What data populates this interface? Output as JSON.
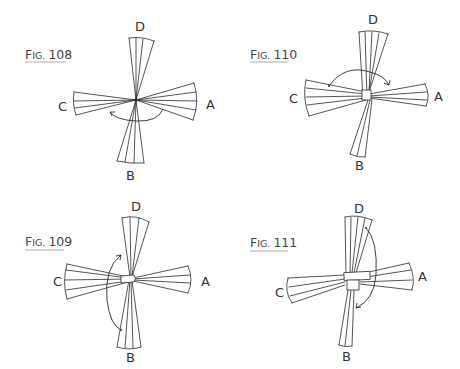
{
  "figures": [
    {
      "id": "fig108",
      "caption": {
        "prefix": "F",
        "small": "IG.",
        "number": "108"
      },
      "labels": {
        "top": "D",
        "bottom": "B",
        "left": "C",
        "right": "A"
      },
      "description": "Four bundles of strips radiating from a single pivot point; curved arrow below center pointing from A side toward C side"
    },
    {
      "id": "fig110",
      "caption": {
        "prefix": "F",
        "small": "IG.",
        "number": "110"
      },
      "labels": {
        "top": "D",
        "bottom": "B",
        "left": "C",
        "right": "A"
      },
      "description": "Strips crossed with small wrapped square at center; curved arrow above center from C side toward A side"
    },
    {
      "id": "fig109",
      "caption": {
        "prefix": "F",
        "small": "IG.",
        "number": "109"
      },
      "labels": {
        "top": "D",
        "bottom": "B",
        "left": "C",
        "right": "A"
      },
      "description": "Strips crossed with horizontal band at center; curved arrow left of center from B side up toward D side"
    },
    {
      "id": "fig111",
      "caption": {
        "prefix": "F",
        "small": "IG.",
        "number": "111"
      },
      "labels": {
        "top": "D",
        "bottom": "B",
        "left": "C",
        "right": "A"
      },
      "description": "Strips crossed with two wrapped bands at center; curved arrow right of center from D side down toward B side"
    }
  ],
  "colors": {
    "ink": "#2a2a2a",
    "caption": "#444444",
    "background": "#ffffff"
  }
}
